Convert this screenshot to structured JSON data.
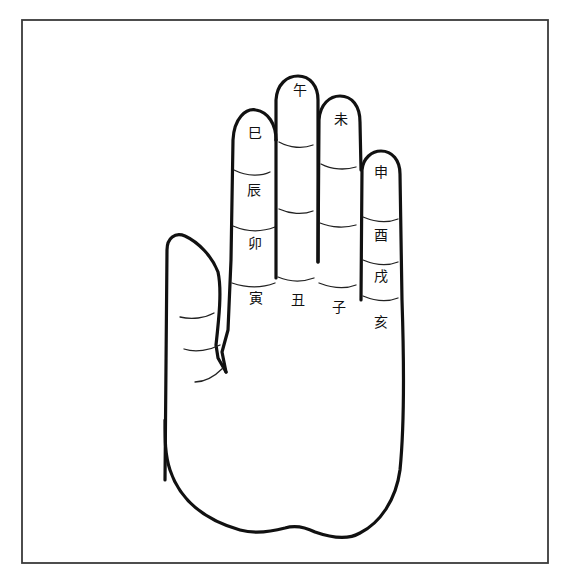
{
  "diagram": {
    "type": "hand-diagram",
    "colors": {
      "line": "#111111",
      "frame": "#3a3a3a",
      "background": "#ffffff"
    },
    "fingers": [
      {
        "name": "index",
        "labels": [
          {
            "id": "si",
            "text": "巳",
            "position": "tip"
          },
          {
            "id": "chen",
            "text": "辰",
            "position": "middle"
          },
          {
            "id": "mao",
            "text": "卯",
            "position": "base"
          },
          {
            "id": "yin",
            "text": "寅",
            "position": "palm"
          }
        ]
      },
      {
        "name": "middle",
        "labels": [
          {
            "id": "wu",
            "text": "午",
            "position": "tip"
          },
          {
            "id": "chou",
            "text": "丑",
            "position": "palm"
          }
        ]
      },
      {
        "name": "ring",
        "labels": [
          {
            "id": "wei",
            "text": "未",
            "position": "tip"
          },
          {
            "id": "zi",
            "text": "子",
            "position": "palm"
          }
        ]
      },
      {
        "name": "little",
        "labels": [
          {
            "id": "shen",
            "text": "申",
            "position": "tip"
          },
          {
            "id": "you",
            "text": "酉",
            "position": "middle"
          },
          {
            "id": "xu",
            "text": "戌",
            "position": "base"
          },
          {
            "id": "hai",
            "text": "亥",
            "position": "palm"
          }
        ]
      }
    ],
    "labels": {
      "si": "巳",
      "wu": "午",
      "wei": "未",
      "shen": "申",
      "chen": "辰",
      "you": "酉",
      "mao": "卯",
      "xu": "戌",
      "yin": "寅",
      "chou": "丑",
      "zi": "子",
      "hai": "亥"
    }
  }
}
